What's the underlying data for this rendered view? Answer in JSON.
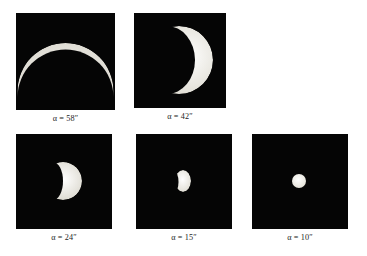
{
  "figure": {
    "background_color": "#ffffff",
    "panel_background_color": "#050505",
    "disk_color": "#f2f0ea",
    "caption_color": "#242424",
    "symbol": "α",
    "unit": "″"
  },
  "panels": [
    {
      "id": "panel-58",
      "caption": "α = 58″",
      "alpha_symbol": "α",
      "equals": "=",
      "value": "58",
      "unit": "″",
      "angular_diameter_arcsec": 58,
      "phase": "thin-crescent",
      "illumination_note": "very thin arc lit along upper limb",
      "x": 16,
      "y": 13,
      "w": 99,
      "h": 97
    },
    {
      "id": "panel-42",
      "caption": "α = 42″",
      "alpha_symbol": "α",
      "equals": "=",
      "value": "42",
      "unit": "″",
      "angular_diameter_arcsec": 42,
      "phase": "crescent",
      "illumination_note": "crescent lit on right limb, horns pointing left",
      "x": 134,
      "y": 13,
      "w": 92,
      "h": 95
    },
    {
      "id": "panel-24",
      "caption": "α = 24″",
      "alpha_symbol": "α",
      "equals": "=",
      "value": "24",
      "unit": "″",
      "angular_diameter_arcsec": 24,
      "phase": "half-disk",
      "illumination_note": "dichotomy, terminator near vertical, lit toward right",
      "x": 16,
      "y": 134,
      "w": 96,
      "h": 95
    },
    {
      "id": "panel-15",
      "caption": "α = 15″",
      "alpha_symbol": "α",
      "equals": "=",
      "value": "15",
      "unit": "″",
      "angular_diameter_arcsec": 15,
      "phase": "gibbous",
      "illumination_note": "small gibbous disk",
      "x": 136,
      "y": 134,
      "w": 96,
      "h": 95
    },
    {
      "id": "panel-10",
      "caption": "α = 10″",
      "alpha_symbol": "α",
      "equals": "=",
      "value": "10",
      "unit": "″",
      "angular_diameter_arcsec": 10,
      "phase": "full",
      "illumination_note": "small nearly full disk",
      "x": 252,
      "y": 134,
      "w": 96,
      "h": 95
    }
  ]
}
